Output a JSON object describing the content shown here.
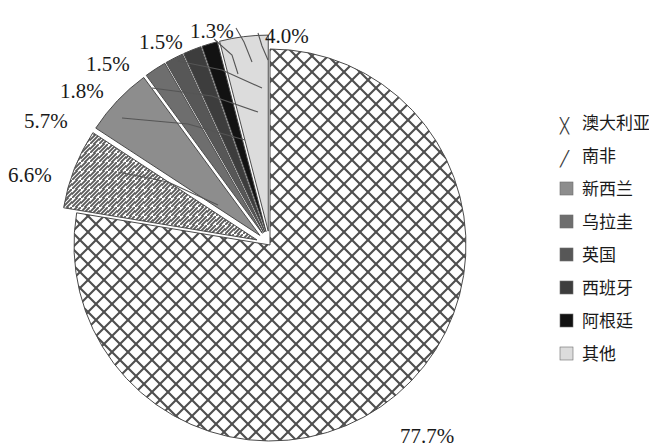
{
  "chart_data": {
    "type": "pie",
    "title": "",
    "subtitle": "",
    "xlabel": "",
    "ylabel": "",
    "units": "percent",
    "start_angle_deg": 0,
    "direction": "clockwise",
    "total": 100.1,
    "categories": [
      "澳大利亚",
      "南非",
      "新西兰",
      "乌拉圭",
      "英国",
      "西班牙",
      "阿根廷",
      "其他"
    ],
    "values": [
      77.7,
      6.6,
      5.7,
      1.8,
      1.5,
      1.5,
      1.3,
      4.0
    ],
    "value_labels": [
      "77.7%",
      "6.6%",
      "5.7%",
      "1.8%",
      "1.5%",
      "1.5%",
      "1.3%",
      "4.0%"
    ],
    "exploded": [
      false,
      true,
      true,
      true,
      true,
      true,
      true,
      true
    ],
    "fills": [
      "#ffffff",
      "#ffffff",
      "#8d8d8d",
      "#6e6e6e",
      "#575757",
      "#3d3d3d",
      "#121212",
      "#dcdcdc"
    ],
    "patterns": [
      "crosshatch-diamond",
      "diagonal-lines",
      "solid",
      "solid",
      "solid",
      "solid",
      "solid",
      "solid"
    ],
    "legend_position": "right",
    "grid": false
  },
  "slices": [
    {
      "name": "australia",
      "label": "澳大利亚",
      "value": 77.7,
      "value_label": "77.7%",
      "pattern": "crosshatch-diamond",
      "fill": "#ffffff",
      "label_x": 400,
      "label_y": 427,
      "exploded": false
    },
    {
      "name": "south-africa",
      "label": "南非",
      "value": 6.6,
      "value_label": "6.6%",
      "pattern": "diagonal-lines",
      "fill": "#ffffff",
      "label_x": 8,
      "label_y": 166,
      "exploded": true
    },
    {
      "name": "new-zealand",
      "label": "新西兰",
      "value": 5.7,
      "value_label": "5.7%",
      "pattern": "solid",
      "fill": "#8d8d8d",
      "label_x": 24,
      "label_y": 112,
      "exploded": true
    },
    {
      "name": "uruguay",
      "label": "乌拉圭",
      "value": 1.8,
      "value_label": "1.8%",
      "pattern": "solid",
      "fill": "#6e6e6e",
      "label_x": 60,
      "label_y": 82,
      "exploded": true
    },
    {
      "name": "united-kingdom",
      "label": "英国",
      "value": 1.5,
      "value_label": "1.5%",
      "pattern": "solid",
      "fill": "#575757",
      "label_x": 86,
      "label_y": 55,
      "exploded": true
    },
    {
      "name": "spain",
      "label": "西班牙",
      "value": 1.5,
      "value_label": "1.5%",
      "pattern": "solid",
      "fill": "#3d3d3d",
      "label_x": 139,
      "label_y": 33,
      "exploded": true
    },
    {
      "name": "argentina",
      "label": "阿根廷",
      "value": 1.3,
      "value_label": "1.3%",
      "pattern": "solid",
      "fill": "#121212",
      "label_x": 190,
      "label_y": 22,
      "exploded": true
    },
    {
      "name": "other",
      "label": "其他",
      "value": 4.0,
      "value_label": "4.0%",
      "pattern": "solid",
      "fill": "#dcdcdc",
      "label_x": 265,
      "label_y": 27,
      "exploded": true
    }
  ],
  "legend": {
    "items": [
      {
        "name": "australia",
        "label": "澳大利亚",
        "swatch": "crosshatch-diamond",
        "fill": "#ffffff"
      },
      {
        "name": "south-africa",
        "label": "南非",
        "swatch": "diagonal-lines",
        "fill": "#ffffff"
      },
      {
        "name": "new-zealand",
        "label": "新西兰",
        "swatch": "solid",
        "fill": "#8d8d8d"
      },
      {
        "name": "uruguay",
        "label": "乌拉圭",
        "swatch": "solid",
        "fill": "#6e6e6e"
      },
      {
        "name": "united-kingdom",
        "label": "英国",
        "swatch": "solid",
        "fill": "#575757"
      },
      {
        "name": "spain",
        "label": "西班牙",
        "swatch": "solid",
        "fill": "#3d3d3d"
      },
      {
        "name": "argentina",
        "label": "阿根廷",
        "swatch": "solid",
        "fill": "#121212"
      },
      {
        "name": "other",
        "label": "其他",
        "swatch": "solid",
        "fill": "#dcdcdc"
      }
    ]
  },
  "geometry": {
    "center_x": 270,
    "center_y": 245,
    "radius": 196,
    "explode_offset": 14,
    "legend_x": 560,
    "legend_start_y": 126,
    "legend_row_height": 33,
    "legend_swatch_size": 13,
    "legend_text_gap": 22
  }
}
